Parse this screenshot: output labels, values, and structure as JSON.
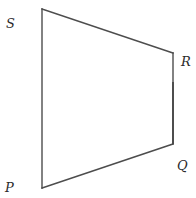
{
  "figure": {
    "type": "quadrilateral",
    "line_color": "#4d4d4d",
    "label_color": "#2b2b2b",
    "vertices": [
      {
        "name": "S",
        "x": 42,
        "y": 9,
        "label_x": 6,
        "label_y": 28
      },
      {
        "name": "R",
        "x": 173,
        "y": 53,
        "label_x": 181,
        "label_y": 66
      },
      {
        "name": "Q",
        "x": 173,
        "y": 144,
        "label_x": 177,
        "label_y": 170
      },
      {
        "name": "P",
        "x": 42,
        "y": 188,
        "label_x": 5,
        "label_y": 192
      }
    ],
    "edges": [
      {
        "from": "S",
        "to": "R"
      },
      {
        "from": "R",
        "to": "Q"
      },
      {
        "from": "Q",
        "to": "P"
      },
      {
        "from": "P",
        "to": "S"
      }
    ]
  },
  "labels": {
    "S": "S",
    "R": "R",
    "Q": "Q",
    "P": "P"
  }
}
